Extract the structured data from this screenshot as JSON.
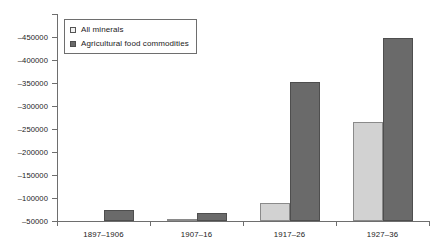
{
  "chart_data": {
    "type": "bar",
    "title": "",
    "subtitle": "",
    "xlabel": "",
    "ylabel": "",
    "grid": false,
    "legend_position": "top-left",
    "axis_inverted": true,
    "categories": [
      "1897–1906",
      "1907–16",
      "1917–26",
      "1927–36"
    ],
    "yticks": [
      -50000,
      -100000,
      -150000,
      -200000,
      -250000,
      -300000,
      -350000,
      -400000,
      -450000
    ],
    "ytick_labels": [
      "–50000",
      "–100000",
      "–150000",
      "–200000",
      "–250000",
      "–300000",
      "–350000",
      "–400000",
      "–450000"
    ],
    "ylim": [
      -50000,
      -500000
    ],
    "series": [
      {
        "name": "All minerals",
        "color": "#d2d2d2",
        "values": [
          -50000,
          -55000,
          -90000,
          -265000
        ]
      },
      {
        "name": "Agricultural food commodities",
        "color": "#6a6a6a",
        "values": [
          -75000,
          -67000,
          -352000,
          -448000
        ]
      }
    ]
  },
  "legend": {
    "items": [
      {
        "label": "All minerals",
        "swatch": "minerals"
      },
      {
        "label": "Agricultural food commodities",
        "swatch": "agri"
      }
    ]
  },
  "colors": {
    "minerals": "#d2d2d2",
    "agricultural": "#6a6a6a",
    "axis": "#6e6e6e",
    "text": "#1a1a1a",
    "background": "#ffffff"
  }
}
